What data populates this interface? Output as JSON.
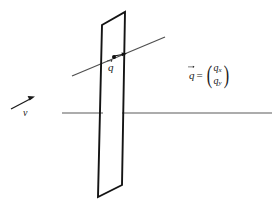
{
  "figure": {
    "kind": "physics-diagram",
    "background_color": "#ffffff",
    "stroke_color": "#1a1a1a",
    "axis_color": "#4a4a4a",
    "faint_color": "#ececec"
  },
  "labels": {
    "q_vector": "q",
    "v_vector": "v"
  },
  "equation": {
    "lhs": "q",
    "operator": "=",
    "paren_open": "(",
    "paren_close": ")",
    "component_x": "q",
    "component_x_sub": "x",
    "component_y": "q",
    "component_y_sub": "y"
  },
  "header": {
    "fragment": ""
  },
  "caption": {
    "fragment": ""
  },
  "geometry": {
    "plane": {
      "top_left": [
        102,
        25
      ],
      "top_right": [
        125,
        12
      ],
      "bottom_right": [
        122,
        185
      ],
      "bottom_left": [
        98,
        197
      ]
    },
    "horizontal_axis": {
      "left_start": [
        62,
        113
      ],
      "left_end": [
        103,
        113
      ],
      "right_start": [
        122,
        113
      ],
      "right_end": [
        272,
        113
      ]
    },
    "slant_line": {
      "start": [
        72,
        76
      ],
      "end": [
        165,
        37
      ]
    },
    "point_q": [
      114,
      57
    ],
    "point_q_arrow_end": [
      126,
      54
    ],
    "v_arrow": {
      "start": [
        11,
        109
      ],
      "end": [
        34,
        97
      ]
    }
  }
}
